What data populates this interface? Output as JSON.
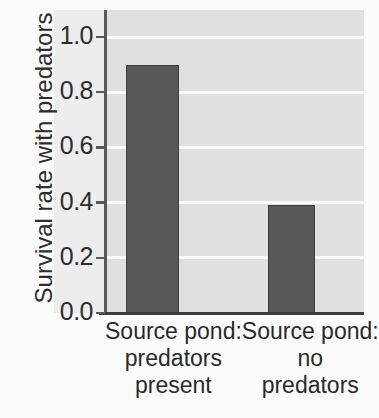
{
  "chart_data": {
    "type": "bar",
    "title": "",
    "xlabel": "",
    "ylabel": "Survival rate with predators",
    "categories": [
      "Source pond: predators present",
      "Source pond: no predators"
    ],
    "category_lines": [
      [
        "Source pond:",
        "predators",
        "present"
      ],
      [
        "Source pond:",
        "no",
        "predators"
      ]
    ],
    "values": [
      0.9,
      0.39
    ],
    "ylim": [
      0.0,
      1.0
    ],
    "yticks": [
      0.0,
      0.2,
      0.4,
      0.6,
      0.8,
      1.0
    ],
    "ytick_labels": [
      "0.0",
      "0.2",
      "0.4",
      "0.6",
      "0.8",
      "1.0"
    ],
    "grid": true,
    "grid_axis": "y",
    "legend": "none",
    "colors": {
      "bar_fill": "#585858",
      "bar_edge": "#3c3c3c",
      "plot_background": "#e0e0e0",
      "gridline": "#fafafa",
      "axis": "#58585a",
      "text": "#2d2d2d",
      "figure_background": "#fbfbfb"
    }
  }
}
